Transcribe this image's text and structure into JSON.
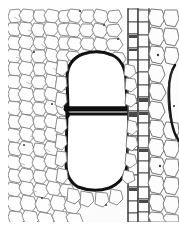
{
  "figure": {
    "kind": "photomicrograph",
    "medium": "monochrome line micrograph",
    "alt_text": "Black and white micrograph of a woody stem cross-section showing two large thick-walled vessel elements separated by a horizontal perforation plate, surrounded by small polygonal parenchyma and fibre cells, with a vertical file of ray cells to the right.",
    "caption": "",
    "width_px": 179,
    "height_px": 229
  },
  "plate": {
    "margin_left_px": 8,
    "margin_top_px": 8,
    "margin_right_px": 0,
    "margin_bottom_px": 7,
    "field_width_px": 171,
    "field_height_px": 214,
    "paper_color": "#ffffff",
    "field_background": "#fdfdfd"
  },
  "palette": {
    "ink_heavy": "#0d0d0d",
    "ink_vessel_wall": "#111111",
    "ink_ray": "#4a4a4a",
    "ink_cell_wall": "#6f6f6f",
    "ink_cell_wall_faint": "#9a9a9a",
    "lumen_fill": "#fefefe",
    "vessel_lumen_fill": "#ffffff",
    "background": "#ffffff"
  },
  "regions": [
    {
      "id": "left-parenchyma",
      "label": "Parenchyma and fibre ground tissue (left)",
      "x": 0,
      "y": 0,
      "w": 58,
      "h": 214,
      "cell_scale_px": 9,
      "wall_tone": "#7a7a7a"
    },
    {
      "id": "vessel-group",
      "label": "Vessel element pair",
      "x": 50,
      "y": 38,
      "w": 68,
      "h": 150
    },
    {
      "id": "ray-file",
      "label": "Vertical ray cell file",
      "x": 118,
      "y": 0,
      "w": 24,
      "h": 214,
      "wall_tone": "#4a4a4a"
    },
    {
      "id": "right-parenchyma",
      "label": "Parenchyma ground tissue (right)",
      "x": 140,
      "y": 0,
      "w": 31,
      "h": 214,
      "cell_scale_px": 12,
      "wall_tone": "#6f6f6f"
    },
    {
      "id": "edge-vessel-fragment",
      "label": "Partial vessel wall at right margin",
      "x": 158,
      "y": 55,
      "w": 13,
      "h": 80
    }
  ],
  "structures": {
    "vessel_upper": {
      "name": "Upper vessel element",
      "lumen_x": 58,
      "lumen_y": 44,
      "lumen_w": 60,
      "lumen_h": 58,
      "wall_thickness_px": 3,
      "shape": "dome-topped"
    },
    "vessel_lower": {
      "name": "Lower vessel element",
      "lumen_x": 58,
      "lumen_y": 104,
      "lumen_w": 62,
      "lumen_h": 74,
      "wall_thickness_px": 3,
      "shape": "rounded-rectangular"
    },
    "perforation_plate": {
      "name": "Simple perforation plate",
      "x1": 58,
      "y1": 101,
      "x2": 120,
      "y2": 101,
      "thickness_px": 5,
      "orientation": "horizontal"
    }
  },
  "scale_bar": {
    "visible": false,
    "label": ""
  },
  "annotations": []
}
